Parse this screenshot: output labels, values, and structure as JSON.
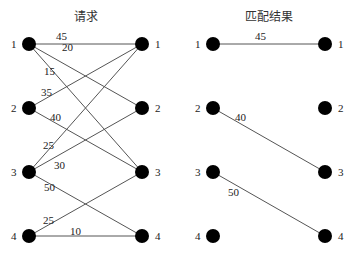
{
  "left_graph": {
    "title": "请求",
    "left_nodes": [
      "1",
      "2",
      "3",
      "4"
    ],
    "right_nodes": [
      "1",
      "2",
      "3",
      "4"
    ],
    "edges": [
      {
        "from": 1,
        "to": 1,
        "weight": "45"
      },
      {
        "from": 1,
        "to": 2,
        "weight": "20"
      },
      {
        "from": 1,
        "to": 3,
        "weight": "15"
      },
      {
        "from": 2,
        "to": 1,
        "weight": "35"
      },
      {
        "from": 2,
        "to": 3,
        "weight": "40"
      },
      {
        "from": 3,
        "to": 1,
        "weight": "25"
      },
      {
        "from": 3,
        "to": 2,
        "weight": "30"
      },
      {
        "from": 3,
        "to": 4,
        "weight": "50"
      },
      {
        "from": 4,
        "to": 3,
        "weight": "25"
      },
      {
        "from": 4,
        "to": 4,
        "weight": "10"
      }
    ]
  },
  "right_graph": {
    "title": "匹配结果",
    "left_nodes": [
      "1",
      "2",
      "3",
      "4"
    ],
    "right_nodes": [
      "1",
      "2",
      "3",
      "4"
    ],
    "edges": [
      {
        "from": 1,
        "to": 1,
        "weight": "45"
      },
      {
        "from": 2,
        "to": 3,
        "weight": "40"
      },
      {
        "from": 3,
        "to": 4,
        "weight": "50"
      }
    ]
  }
}
